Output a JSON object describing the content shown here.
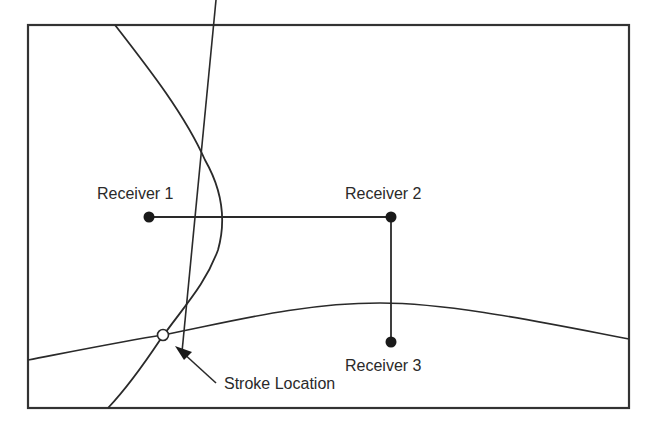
{
  "diagram": {
    "title": "",
    "receivers": [
      {
        "id": 1,
        "label": "Receiver 1",
        "x": 149,
        "y": 217
      },
      {
        "id": 2,
        "label": "Receiver 2",
        "x": 391,
        "y": 217
      },
      {
        "id": 3,
        "label": "Receiver 3",
        "x": 391,
        "y": 342
      }
    ],
    "stroke": {
      "label": "Stroke Location",
      "x": 163,
      "y": 335
    },
    "colors": {
      "line": "#2a2a2a",
      "background": "#ffffff",
      "frame": "#333333"
    }
  }
}
